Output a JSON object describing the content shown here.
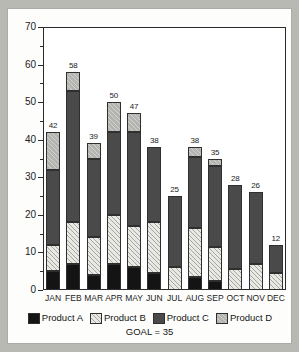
{
  "chart_data": {
    "type": "bar",
    "subtype": "stacked-vertical",
    "title": "",
    "xlabel": "",
    "ylabel": "",
    "ylim": [
      0,
      70
    ],
    "ytick_step": 10,
    "yticks": [
      0,
      10,
      20,
      30,
      40,
      50,
      60,
      70
    ],
    "ytick_labels": [
      "0",
      "10",
      "20",
      "30",
      "40",
      "50",
      "60",
      "70"
    ],
    "grid": false,
    "legend_position": "bottom",
    "categories": [
      "JAN",
      "FEB",
      "MAR",
      "APR",
      "MAY",
      "JUN",
      "JUL",
      "AUG",
      "SEP",
      "OCT",
      "NOV",
      "DEC"
    ],
    "series": [
      {
        "name": "Product A",
        "color": "#141414",
        "pattern": "solid",
        "values": [
          5,
          7,
          4,
          7,
          6,
          4.5,
          0,
          3.5,
          2.5,
          0,
          0,
          0
        ]
      },
      {
        "name": "Product B",
        "color": "#e9e9e4",
        "pattern": "hatch-light",
        "values": [
          7,
          11,
          10,
          13,
          11,
          13.5,
          6,
          13,
          9,
          5.5,
          7,
          4.5
        ]
      },
      {
        "name": "Product C",
        "color": "#4a4a4a",
        "pattern": "solid",
        "values": [
          20,
          35,
          21,
          22,
          25,
          20,
          19,
          19,
          21.5,
          22.5,
          19,
          7.5
        ]
      },
      {
        "name": "Product D",
        "color": "#b4b4b0",
        "pattern": "hatch-grey",
        "values": [
          10,
          5,
          4,
          8,
          5,
          0,
          0,
          2.5,
          2,
          0,
          0,
          0
        ]
      }
    ],
    "totals": [
      42,
      58,
      39,
      50,
      47,
      38,
      25,
      38,
      35,
      28,
      26,
      12
    ],
    "total_labels": [
      "42",
      "58",
      "39",
      "50",
      "47",
      "38",
      "25",
      "38",
      "35",
      "28",
      "26",
      "12"
    ],
    "annotation": "GOAL = 35",
    "goal_value": 35
  },
  "legend": {
    "items": [
      {
        "label": "Product A",
        "color": "#141414"
      },
      {
        "label": "Product B",
        "color": "#e9e9e4"
      },
      {
        "label": "Product C",
        "color": "#4a4a4a"
      },
      {
        "label": "Product D",
        "color": "#b4b4b0"
      }
    ]
  }
}
